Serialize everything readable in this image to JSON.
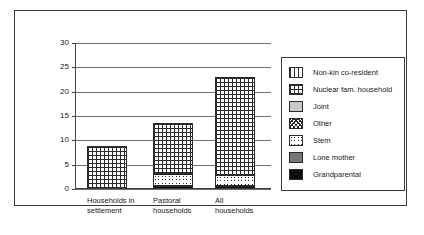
{
  "chart_data": {
    "type": "bar",
    "stacked": true,
    "title": "",
    "subtitle": "",
    "xlabel": "",
    "ylabel": "",
    "ylim": [
      0,
      30
    ],
    "yticks": [
      0,
      5,
      10,
      15,
      20,
      25,
      30
    ],
    "grid": true,
    "legend_position": "right",
    "categories": [
      "Households in settlement",
      "Pastoral households",
      "All households"
    ],
    "series": [
      {
        "name": "Grandparental",
        "pattern": "solid-black",
        "values": [
          0,
          0.6,
          0.7
        ]
      },
      {
        "name": "Lone mother",
        "pattern": "solid-dark-gray",
        "values": [
          0,
          0,
          0
        ]
      },
      {
        "name": "Stem",
        "pattern": "circles",
        "values": [
          0,
          2.4,
          2.2
        ]
      },
      {
        "name": "Other",
        "pattern": "speckle",
        "values": [
          0,
          0,
          0
        ]
      },
      {
        "name": "Joint",
        "pattern": "solid-light-gray",
        "values": [
          0,
          0,
          0
        ]
      },
      {
        "name": "Nuclear fam. household",
        "pattern": "grid",
        "values": [
          8.8,
          10.6,
          20.1
        ]
      },
      {
        "name": "Non-kin co-resident",
        "pattern": "vertical-lines",
        "values": [
          0,
          0,
          0
        ]
      }
    ],
    "totals": [
      8.8,
      13.6,
      23.0
    ]
  },
  "axis": {
    "yticks": [
      {
        "value": 30,
        "label": "30"
      },
      {
        "value": 25,
        "label": "25"
      },
      {
        "value": 20,
        "label": "20"
      },
      {
        "value": 15,
        "label": "15"
      },
      {
        "value": 10,
        "label": "10"
      },
      {
        "value": 5,
        "label": "5"
      },
      {
        "value": 0,
        "label": "0"
      }
    ],
    "xticks": [
      {
        "line1": "Households in",
        "line2": "settlement"
      },
      {
        "line1": "Pastoral",
        "line2": "households"
      },
      {
        "line1": "All",
        "line2": "households"
      }
    ]
  },
  "legend": {
    "items": [
      {
        "label": "Non-kin co-resident",
        "pattern": "pat-nonkin"
      },
      {
        "label": "Nuclear fam. household",
        "pattern": "pat-nuclear"
      },
      {
        "label": "Joint",
        "pattern": "pat-joint"
      },
      {
        "label": "Other",
        "pattern": "pat-other"
      },
      {
        "label": "Stem",
        "pattern": "pat-stem"
      },
      {
        "label": "Lone mother",
        "pattern": "pat-lonemother"
      },
      {
        "label": "Grandparental",
        "pattern": "pat-grandparental"
      }
    ]
  },
  "colors": {
    "frame": "#3a3a3a",
    "gridline": "#6d6d6d",
    "text": "#1a1a1a",
    "background": "#ffffff",
    "black_fill": "#0d0d0d",
    "dark_gray_fill": "#767676",
    "light_gray_fill": "#c9c9c9"
  }
}
